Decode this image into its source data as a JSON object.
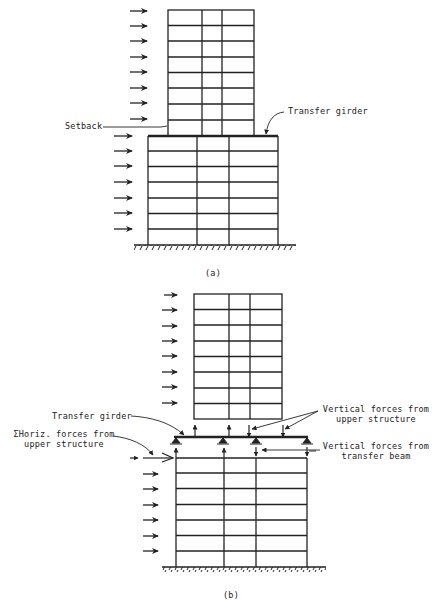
{
  "figure_a": {
    "caption": "(a)",
    "labels": {
      "setback": "Setback",
      "transfer_girder": "Transfer girder"
    },
    "upper_tower": {
      "x": [
        168,
        202,
        222,
        254
      ],
      "y_top": 10,
      "y_bottom": 136,
      "stories": 8
    },
    "lower_block": {
      "x": [
        148,
        197,
        229,
        278
      ],
      "y_top": 136,
      "y_bottom": 245,
      "stories": 7
    },
    "wind_arrows_upper_y": [
      11,
      26,
      41,
      57,
      72,
      88,
      103,
      119
    ],
    "wind_arrows_lower_y": [
      136,
      151,
      166,
      182,
      198,
      213,
      229
    ]
  },
  "figure_b": {
    "caption": "(b)",
    "labels": {
      "transfer_girder": "Transfer girder",
      "horiz_forces_line1": "ΣHoriz. forces from",
      "horiz_forces_line2": "upper structure",
      "vertical_upper_line1": "Vertical forces from",
      "vertical_upper_line2": "upper structure",
      "vertical_beam_line1": "Vertical forces from",
      "vertical_beam_line2": "transfer beam"
    },
    "upper_tower": {
      "x": [
        194,
        229,
        250,
        282
      ],
      "y_top": 294,
      "y_bottom": 419,
      "stories": 8
    },
    "transfer_girder": {
      "x1": 174,
      "x2": 308,
      "y": 437
    },
    "lower_block": {
      "x": [
        176,
        224,
        256,
        307
      ],
      "y_top": 458,
      "y_bottom": 567,
      "stories": 7
    }
  }
}
